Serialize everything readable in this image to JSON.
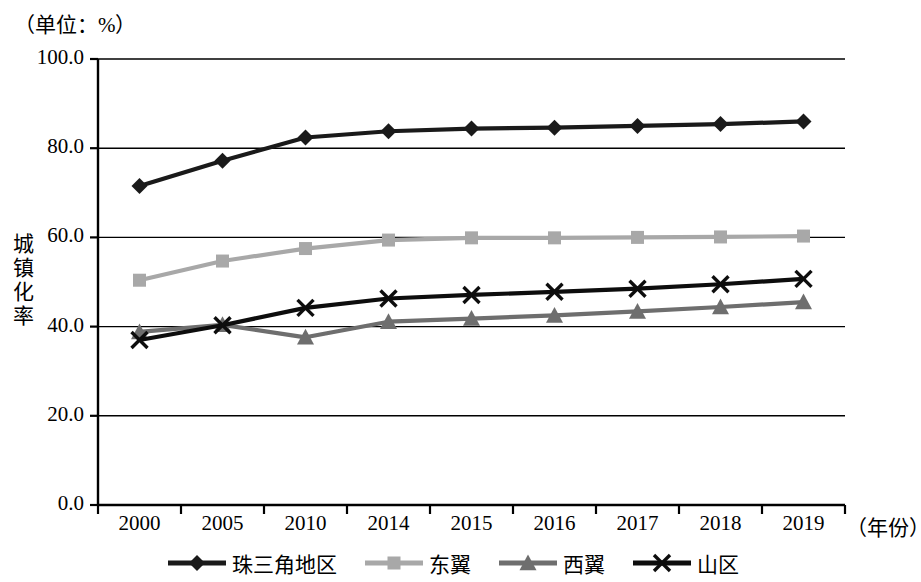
{
  "chart_data": {
    "type": "line",
    "title": "",
    "unit_note": "（单位：%）",
    "xlabel": "（年份）",
    "ylabel": "城镇化率",
    "categories": [
      "2000",
      "2005",
      "2010",
      "2014",
      "2015",
      "2016",
      "2017",
      "2018",
      "2019"
    ],
    "ylim": [
      0,
      100
    ],
    "ytick_labels": [
      "0.0",
      "20.0",
      "40.0",
      "60.0",
      "80.0",
      "100.0"
    ],
    "ytick_values": [
      0,
      20,
      40,
      60,
      80,
      100
    ],
    "grid": true,
    "legend_position": "bottom",
    "series": [
      {
        "name": "珠三角地区",
        "marker": "diamond",
        "color": "#1a1a1a",
        "values": [
          71.5,
          77.2,
          82.4,
          83.8,
          84.4,
          84.6,
          85.0,
          85.4,
          86.0
        ]
      },
      {
        "name": "东翼",
        "marker": "square",
        "color": "#a8a8a8",
        "values": [
          50.4,
          54.7,
          57.5,
          59.4,
          59.9,
          59.9,
          60.0,
          60.1,
          60.3
        ]
      },
      {
        "name": "西翼",
        "marker": "triangle",
        "color": "#6e6e6e",
        "values": [
          38.8,
          40.4,
          37.6,
          41.1,
          41.8,
          42.5,
          43.4,
          44.4,
          45.5
        ]
      },
      {
        "name": "山区",
        "marker": "x",
        "color": "#0d0d0d",
        "values": [
          37.0,
          40.3,
          44.2,
          46.3,
          47.1,
          47.8,
          48.5,
          49.5,
          50.7
        ]
      }
    ]
  }
}
